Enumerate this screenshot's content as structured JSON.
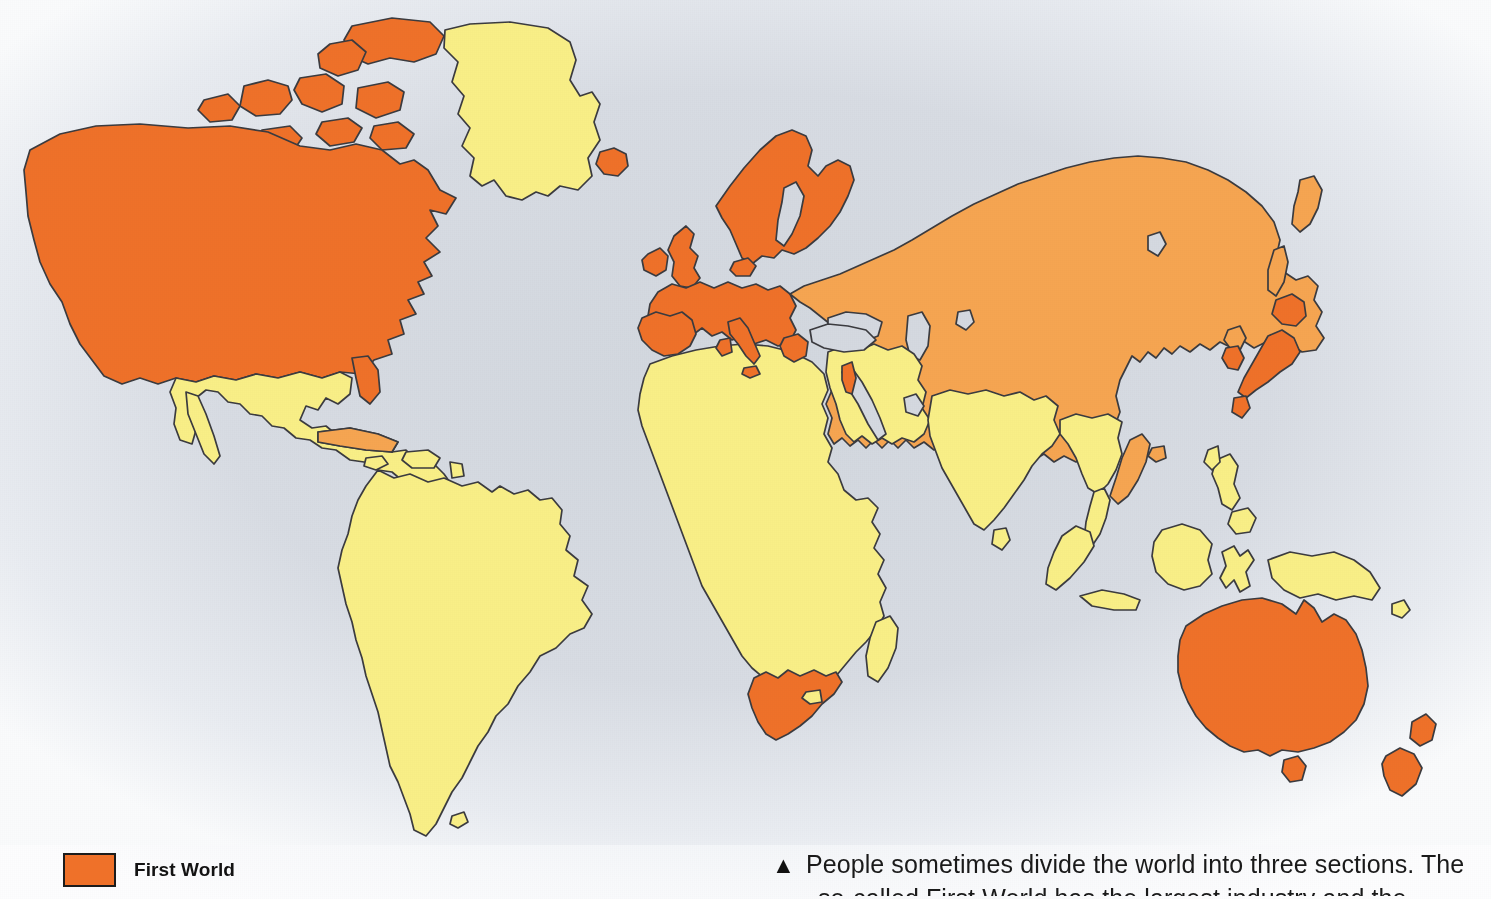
{
  "figure": {
    "kind": "world-map",
    "background_color": "#e6eaef",
    "ocean_color": "#d5d9e0",
    "outline_color": "#3b3b3f"
  },
  "legend": {
    "items": [
      {
        "label": "First World",
        "color": "#ef7129",
        "border_color": "#1c1c1c",
        "icon": "color-swatch"
      }
    ]
  },
  "categories": {
    "first_world": {
      "name": "First World",
      "color": "#ef7129",
      "regions": [
        "United States",
        "Canada",
        "Canadian Arctic Archipelago",
        "Iceland",
        "United Kingdom",
        "Ireland",
        "Norway",
        "Sweden",
        "Finland",
        "Denmark",
        "France",
        "Spain",
        "Portugal",
        "Germany",
        "Italy",
        "Austria",
        "Switzerland",
        "Belgium",
        "Netherlands",
        "Greece",
        "Israel",
        "Japan",
        "South Korea",
        "Australia",
        "New Zealand",
        "Tasmania",
        "South Africa"
      ]
    },
    "second_world": {
      "name": "Second World",
      "color": "#f6a551",
      "regions": [
        "Russia",
        "Kazakhstan",
        "Ukraine",
        "Belarus",
        "Poland",
        "Czechoslovakia",
        "Hungary",
        "Romania",
        "Bulgaria",
        "Yugoslavia",
        "China",
        "Mongolia",
        "North Korea",
        "Vietnam",
        "Cuba"
      ]
    },
    "third_world": {
      "name": "Third World",
      "color": "#f9ef87",
      "regions": [
        "Mexico",
        "Central America",
        "Caribbean",
        "South America",
        "Greenland",
        "Africa",
        "Middle East",
        "India",
        "Southeast Asia",
        "Indonesia",
        "Philippines",
        "Papua New Guinea",
        "Madagascar"
      ]
    }
  },
  "caption": {
    "marker": "▲",
    "line1": "People sometimes divide the world into three sections. The",
    "line2": "so-called First World has the largest industry and the"
  }
}
